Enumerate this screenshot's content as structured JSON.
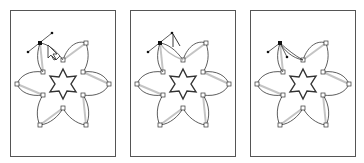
{
  "figure": {
    "panels": [
      {
        "id": 1,
        "step": "hover anchor with convert-anchor cursor",
        "cursor": "convert-point-cursor"
      },
      {
        "id": 2,
        "step": "drag direction handle",
        "cursor": "direction-select-cursor"
      },
      {
        "id": 3,
        "step": "handle moved, petal reshaped",
        "cursor": "none"
      }
    ]
  },
  "colors": {
    "stroke": "#333333",
    "ghost": "#bbbbbb",
    "frame": "#555555",
    "anchor_selected": "#111111"
  }
}
